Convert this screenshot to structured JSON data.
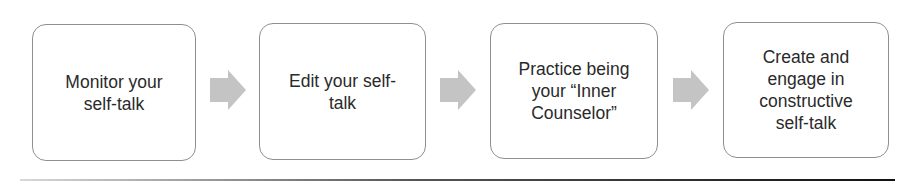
{
  "steps": [
    {
      "label": "Monitor your\nself-talk"
    },
    {
      "label": "Edit your self-\ntalk"
    },
    {
      "label": "Practice being\nyour “Inner\nCounselor”"
    },
    {
      "label": "Create and\nengage in\nconstructive\nself-talk"
    }
  ],
  "arrow_color": "#c4c4c4",
  "box_border_color": "#8f8f8f"
}
